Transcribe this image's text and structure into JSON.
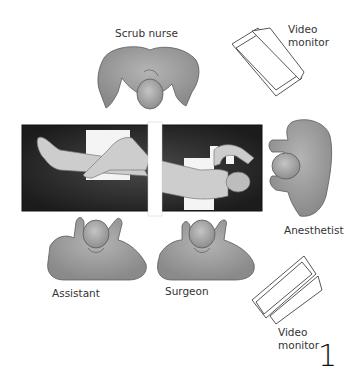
{
  "figure": {
    "number": "1",
    "type": "operating room setup diagram (top view)"
  },
  "labels": {
    "scrub_nurse": "Scrub nurse",
    "video_monitor_top_line1": "Video",
    "video_monitor_top_line2": "monitor",
    "anesthetist": "Anesthetist",
    "assistant": "Assistant",
    "surgeon": "Surgeon",
    "video_monitor_bottom_line1": "Video",
    "video_monitor_bottom_line2": "monitor"
  },
  "colors": {
    "table": "#2b2b2b",
    "person": "#9a9a9a",
    "person_outline": "#5a5a5a",
    "patient_skin": "#c9c9c9",
    "drape": "#ffffff"
  }
}
